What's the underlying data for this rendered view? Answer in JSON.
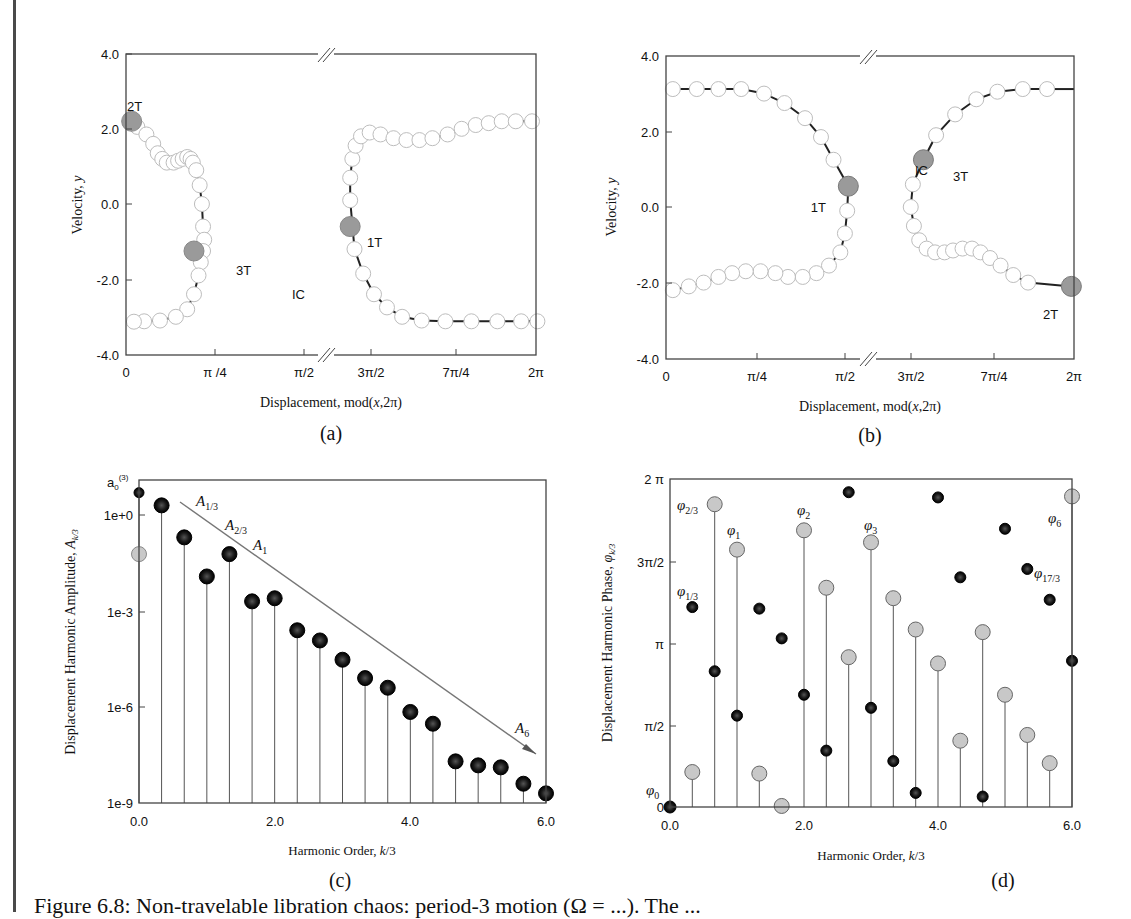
{
  "figure": {
    "caption": "Figure 6.8: Non-travelable libration chaos: period-3 motion (Ω = ...). The ...",
    "panels": [
      {
        "id": "a",
        "label": "(a)"
      },
      {
        "id": "b",
        "label": "(b)"
      },
      {
        "id": "c",
        "label": "(c)"
      },
      {
        "id": "d",
        "label": "(d)"
      }
    ]
  },
  "colors": {
    "axis": "#444444",
    "curve": "#222222",
    "open_marker_fill": "#ffffff",
    "open_marker_stroke": "#bdbdbd",
    "highlight_fill": "#9a9a9a",
    "dark_marker": "#1a1a1a",
    "grey_marker": "#c8c8c8",
    "trend_line": "#777777"
  },
  "chart_data": [
    {
      "id": "a",
      "type": "scatter",
      "title": "",
      "xlabel": "Displacement, mod(x,2π)",
      "ylabel": "Velocity, y",
      "ylim": [
        -4.0,
        4.0
      ],
      "yticks": [
        "4.0",
        "2.0",
        "0.0",
        "-2.0",
        "-4.0"
      ],
      "xticks": [
        "0",
        "π/4",
        "π/2",
        "3π/2",
        "7π/4",
        "2π"
      ],
      "axis_break": "between π/2 and 3π/2",
      "series": [
        {
          "name": "left branch",
          "x": [
            0.05,
            0.1,
            0.18,
            0.24,
            0.28,
            0.32,
            0.36,
            0.42,
            0.46,
            0.5,
            0.54,
            0.57,
            0.59,
            0.62,
            0.65,
            0.67,
            0.68,
            0.69,
            0.68,
            0.66,
            0.64,
            0.6,
            0.54,
            0.44,
            0.3,
            0.16,
            0.07
          ],
          "y": [
            2.2,
            2.05,
            1.85,
            1.6,
            1.35,
            1.2,
            1.1,
            1.1,
            1.15,
            1.2,
            1.25,
            1.2,
            1.1,
            0.9,
            0.5,
            0.0,
            -0.6,
            -0.95,
            -1.25,
            -1.55,
            -1.9,
            -2.4,
            -2.8,
            -3.0,
            -3.1,
            -3.12,
            -3.13
          ]
        },
        {
          "name": "right branch",
          "x": [
            4.52,
            4.52,
            4.54,
            4.57,
            4.62,
            4.7,
            4.8,
            4.92,
            5.04,
            5.16,
            5.28,
            5.42,
            5.55,
            5.68,
            5.8,
            5.92,
            6.05,
            6.2,
            4.56,
            4.64,
            4.74,
            4.86,
            5.0,
            5.18,
            5.4,
            5.64,
            5.88,
            6.1,
            6.25
          ],
          "y": [
            0.1,
            0.7,
            1.2,
            1.55,
            1.8,
            1.9,
            1.85,
            1.75,
            1.7,
            1.7,
            1.75,
            1.85,
            2.0,
            2.1,
            2.15,
            2.2,
            2.2,
            2.2,
            -1.2,
            -1.85,
            -2.4,
            -2.75,
            -3.0,
            -3.1,
            -3.12,
            -3.12,
            -3.12,
            -3.12,
            -3.12
          ]
        }
      ],
      "annotations": [
        {
          "text": "2T",
          "x": 0.05,
          "y": 2.2
        },
        {
          "text": "3T",
          "x": 0.6,
          "y": -1.25
        },
        {
          "text": "IC",
          "x": 0.6,
          "y": -1.25
        },
        {
          "text": "1T",
          "x": 4.52,
          "y": -0.6
        }
      ]
    },
    {
      "id": "b",
      "type": "scatter",
      "xlabel": "Displacement, mod(x,2π)",
      "ylabel": "Velocity, y",
      "ylim": [
        -4.0,
        4.0
      ],
      "yticks": [
        "4.0",
        "2.0",
        "0.0",
        "-2.0",
        "-4.0"
      ],
      "xticks": [
        "0",
        "π/4",
        "π/2",
        "3π/2",
        "7π/4",
        "2π"
      ],
      "axis_break": "between π/2 and 3π/2",
      "annotations": [
        {
          "text": "1T",
          "x": 1.68,
          "y": 0.55
        },
        {
          "text": "IC",
          "x": 4.75,
          "y": 1.25
        },
        {
          "text": "3T",
          "x": 4.75,
          "y": 1.25
        },
        {
          "text": "2T",
          "x": 6.23,
          "y": -2.1
        }
      ]
    },
    {
      "id": "c",
      "type": "bar",
      "xlabel": "Harmonic Order, k/3",
      "ylabel": "Displacement Harmonic Amplitude, A_k/3",
      "yscale": "log",
      "ylim": [
        1e-09,
        100
      ],
      "yticks": [
        "1e+0",
        "1e-3",
        "1e-6",
        "1e-9"
      ],
      "xticks": [
        "0.0",
        "2.0",
        "4.0",
        "6.0"
      ],
      "categories": [
        0.0,
        0.333,
        0.667,
        1.0,
        1.333,
        1.667,
        2.0,
        2.333,
        2.667,
        3.0,
        3.333,
        3.667,
        4.0,
        4.333,
        4.667,
        5.0,
        5.333,
        5.667,
        6.0
      ],
      "values": [
        5.0,
        2.0,
        0.2,
        0.012,
        0.06,
        0.002,
        0.0025,
        0.00025,
        0.00012,
        3e-05,
        8e-06,
        4e-06,
        7e-07,
        3e-07,
        2e-08,
        1.5e-08,
        1.3e-08,
        4e-09,
        2e-09
      ],
      "a0_grey_value": 0.06,
      "annotations": [
        "a0(3)",
        "A1/3",
        "A2/3",
        "A1",
        "A6"
      ],
      "trend_line": {
        "from": [
          0.55,
          2.0
        ],
        "to": [
          5.85,
          1.3e-08
        ]
      }
    },
    {
      "id": "d",
      "type": "scatter",
      "xlabel": "Harmonic Order, k/3",
      "ylabel": "Displacement Harmonic Phase, φk/3",
      "ylim": [
        0,
        6.2832
      ],
      "yticks": [
        "2π",
        "3π/2",
        "π",
        "π/2",
        "0"
      ],
      "xticks": [
        "0.0",
        "2.0",
        "4.0",
        "6.0"
      ],
      "series": [
        {
          "name": "grey (stems)",
          "x": [
            0.333,
            0.667,
            1.0,
            1.333,
            1.667,
            2.0,
            2.333,
            2.667,
            3.0,
            3.333,
            3.667,
            4.0,
            4.333,
            4.667,
            5.0,
            5.333,
            5.667,
            6.0
          ],
          "y": [
            0.67,
            5.8,
            4.93,
            0.64,
            0.02,
            5.3,
            4.2,
            2.87,
            5.07,
            4.0,
            3.4,
            2.75,
            1.27,
            3.35,
            2.15,
            1.38,
            0.84,
            5.95
          ]
        },
        {
          "name": "dark",
          "x": [
            0.0,
            0.333,
            0.667,
            1.0,
            1.333,
            1.667,
            2.0,
            2.333,
            2.667,
            3.0,
            3.333,
            3.667,
            4.0,
            4.333,
            4.667,
            5.0,
            5.333,
            5.667,
            6.0
          ],
          "y": [
            0.0,
            3.83,
            2.6,
            1.75,
            3.8,
            3.23,
            2.15,
            1.08,
            6.03,
            1.9,
            0.88,
            0.27,
            5.93,
            4.4,
            0.2,
            5.33,
            4.56,
            3.97,
            2.8
          ]
        }
      ],
      "annotations": [
        "φ0",
        "φ1/3",
        "φ2/3",
        "φ1",
        "φ2",
        "φ3",
        "φ6",
        "φ17/3"
      ]
    }
  ],
  "text": {
    "a": {
      "xlabel": "Displacement, mod(",
      "xvar": "x",
      "xlabel_end": ",2π)",
      "ylabel": "Velocity, ",
      "yvar": "y",
      "yticks": [
        "4.0",
        "2.0",
        "0.0",
        "-2.0",
        "-4.0"
      ],
      "xticks": [
        "0",
        "π /4",
        "π/2",
        "3π/2",
        "7π/4",
        "2π"
      ],
      "ann": {
        "t2": "2T",
        "t3": "3T",
        "ic": "IC",
        "t1": "1T"
      }
    },
    "b": {
      "xlabel": "Displacement, mod(",
      "xvar": "x",
      "xlabel_end": ",2π)",
      "ylabel": "Velocity, ",
      "yvar": "y",
      "yticks": [
        "4.0",
        "2.0",
        "0.0",
        "-2.0",
        "-4.0"
      ],
      "xticks": [
        "0",
        "π/4",
        "π/2",
        "3π/2",
        "7π/4",
        "2π"
      ],
      "ann": {
        "t1": "1T",
        "ic": "IC",
        "t3": "3T",
        "t2": "2T"
      }
    },
    "c": {
      "xlabel": "Harmonic Order, ",
      "xvar": "k",
      "xlabel_end": "/3",
      "ylabel": "Displacement Harmonic Amplitude, ",
      "yvar": "A",
      "ysub": "k/3",
      "yticks": [
        "1e+0",
        "1e-3",
        "1e-6",
        "1e-9"
      ],
      "xticks": [
        "0.0",
        "2.0",
        "4.0",
        "6.0"
      ],
      "a0": "a",
      "a0sub": "0",
      "a0sup": "(3)",
      "A": "A",
      "subs": [
        "1/3",
        "2/3",
        "1",
        "6"
      ]
    },
    "d": {
      "xlabel": "Harmonic Order, ",
      "xvar": "k",
      "xlabel_end": "/3",
      "ylabel": "Displacement Harmonic Phase, ",
      "yvar": "φ",
      "ysub": "k/3",
      "yticks": [
        "2 π",
        "3π/2",
        "π",
        "π/2",
        "0"
      ],
      "xticks": [
        "0.0",
        "2.0",
        "4.0",
        "6.0"
      ],
      "phi": "φ",
      "subs": [
        "0",
        "1/3",
        "2/3",
        "1",
        "2",
        "3",
        "6",
        "17/3"
      ]
    }
  }
}
